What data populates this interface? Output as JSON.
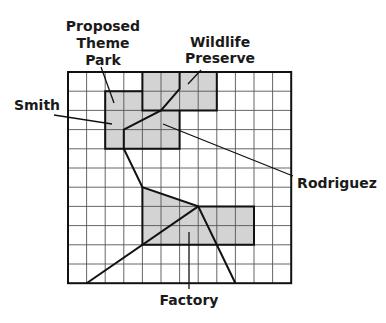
{
  "diagram": {
    "title": "",
    "grid": {
      "columns": 12,
      "rows": 11,
      "origin_x": 68,
      "origin_y": 72,
      "cell_w": 18.6,
      "cell_h": 19.2,
      "grid_line_color": "#555555",
      "border_color": "#111111"
    },
    "fill_color": "#d3d3d3",
    "regions": [
      {
        "name": "Wildlife Preserve",
        "cells": "cols 4-8, rows 0-2"
      },
      {
        "name": "Proposed Theme Park",
        "cells": "cols 2-6, rows 1-4"
      },
      {
        "name": "Factory",
        "cells": "cols 4-10, rows 6-9 (polygon)"
      }
    ],
    "labels": {
      "theme_park": [
        "Proposed",
        "Theme",
        "Park"
      ],
      "wildlife": [
        "Wildlife",
        "Preserve"
      ],
      "smith": "Smith",
      "rodriguez": "Rodriguez",
      "factory": "Factory"
    }
  }
}
